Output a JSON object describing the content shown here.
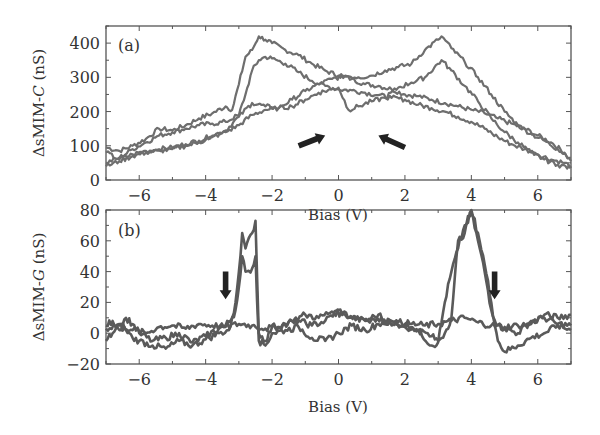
{
  "chart_data": [
    {
      "panel": "(a)",
      "type": "line",
      "title": "",
      "xlabel": "Bias (V)",
      "ylabel_prefix": "ΔsMIM-",
      "ylabel_italic": "C",
      "ylabel_suffix": " (nS)",
      "xlim": [
        -7,
        7
      ],
      "ylim": [
        0,
        450
      ],
      "xticks": [
        -6,
        -4,
        -2,
        0,
        2,
        4,
        6
      ],
      "xtick_labels": [
        "−6",
        "−4",
        "−2",
        "0",
        "2",
        "4",
        "6"
      ],
      "yticks": [
        0,
        100,
        200,
        300,
        400
      ],
      "ytick_labels": [
        "0",
        "100",
        "200",
        "300",
        "400"
      ],
      "grid": false,
      "series": [
        {
          "name": "sweep-1",
          "x": [
            -7,
            -6.6,
            -6.2,
            -5.8,
            -5.4,
            -5,
            -4.6,
            -4.2,
            -3.8,
            -3.4,
            -3.2,
            -3.0,
            -2.8,
            -2.6,
            -2.4,
            -2.2,
            -2.0,
            -1.6,
            -1.2,
            -0.8,
            -0.4,
            0,
            0.4,
            0.8,
            1.2,
            1.6,
            2.0,
            2.4,
            2.8,
            3.2,
            3.6,
            4.0,
            4.4,
            4.8,
            5.2,
            5.6,
            6.0,
            6.4,
            6.8,
            7
          ],
          "y": [
            95,
            85,
            100,
            120,
            150,
            145,
            160,
            180,
            195,
            215,
            205,
            280,
            360,
            380,
            420,
            410,
            400,
            380,
            365,
            340,
            320,
            305,
            295,
            280,
            275,
            265,
            250,
            245,
            235,
            225,
            215,
            205,
            195,
            180,
            165,
            150,
            130,
            110,
            80,
            55
          ]
        },
        {
          "name": "sweep-2",
          "x": [
            -7,
            -6.6,
            -6.2,
            -5.8,
            -5.4,
            -5,
            -4.6,
            -4.2,
            -3.8,
            -3.4,
            -3.0,
            -2.8,
            -2.6,
            -2.4,
            -2.2,
            -2.0,
            -1.6,
            -1.2,
            -0.8,
            -0.4,
            0,
            0.4,
            0.8,
            1.2,
            1.6,
            2.0,
            2.4,
            2.8,
            3.2,
            3.6,
            4.0,
            4.4,
            4.8,
            5.2,
            5.6,
            6.0,
            6.4,
            6.8,
            7
          ],
          "y": [
            50,
            65,
            90,
            110,
            130,
            140,
            150,
            160,
            165,
            170,
            190,
            250,
            320,
            350,
            360,
            355,
            340,
            315,
            290,
            275,
            265,
            262,
            255,
            248,
            240,
            235,
            220,
            210,
            200,
            185,
            170,
            150,
            125,
            105,
            90,
            75,
            60,
            50,
            40
          ]
        },
        {
          "name": "sweep-3",
          "x": [
            -7,
            -6.6,
            -6.2,
            -5.8,
            -5.4,
            -5,
            -4.6,
            -4.2,
            -3.8,
            -3.4,
            -3.0,
            -2.6,
            -2.2,
            -1.8,
            -1.4,
            -1.0,
            -0.6,
            -0.2,
            0.2,
            0.6,
            1.0,
            1.4,
            1.8,
            2.2,
            2.6,
            3.0,
            3.1,
            3.4,
            3.8,
            4.2,
            4.6,
            5.0,
            5.4,
            5.8,
            6.2,
            6.6,
            7
          ],
          "y": [
            80,
            60,
            75,
            85,
            90,
            95,
            105,
            115,
            130,
            145,
            185,
            225,
            215,
            210,
            235,
            260,
            280,
            295,
            305,
            300,
            305,
            320,
            330,
            340,
            380,
            410,
            420,
            385,
            345,
            300,
            250,
            200,
            160,
            135,
            115,
            90,
            65
          ]
        },
        {
          "name": "sweep-4",
          "x": [
            -7,
            -6.6,
            -6.2,
            -5.8,
            -5.4,
            -5,
            -4.6,
            -4.2,
            -3.8,
            -3.4,
            -3.0,
            -2.6,
            -2.2,
            -1.8,
            -1.4,
            -1.0,
            -0.6,
            -0.2,
            0.0,
            0.3,
            0.6,
            1.0,
            1.4,
            1.8,
            2.2,
            2.6,
            3.1,
            3.4,
            3.8,
            4.2,
            4.6,
            5.0,
            5.4,
            5.8,
            6.2,
            6.6,
            7
          ],
          "y": [
            40,
            55,
            70,
            80,
            85,
            90,
            100,
            110,
            125,
            140,
            160,
            190,
            205,
            210,
            215,
            235,
            255,
            265,
            270,
            205,
            215,
            230,
            240,
            270,
            285,
            300,
            350,
            320,
            275,
            230,
            180,
            140,
            110,
            80,
            60,
            45,
            35
          ]
        }
      ],
      "annotations": [
        {
          "type": "arrow",
          "label": "sweep-direction-right",
          "from": [
            -1.2,
            100
          ],
          "to": [
            -0.4,
            130
          ]
        },
        {
          "type": "arrow",
          "label": "sweep-direction-left",
          "from": [
            2.0,
            95
          ],
          "to": [
            1.2,
            130
          ]
        }
      ]
    },
    {
      "panel": "(b)",
      "type": "line",
      "title": "",
      "xlabel": "Bias (V)",
      "ylabel_prefix": "ΔsMIM-",
      "ylabel_italic": "G",
      "ylabel_suffix": " (nS)",
      "xlim": [
        -7,
        7
      ],
      "ylim": [
        -20,
        80
      ],
      "xticks": [
        -6,
        -4,
        -2,
        0,
        2,
        4,
        6
      ],
      "xtick_labels": [
        "−6",
        "−4",
        "−2",
        "0",
        "2",
        "4",
        "6"
      ],
      "yticks": [
        -20,
        0,
        20,
        40,
        60,
        80
      ],
      "ytick_labels": [
        "−20",
        "0",
        "20",
        "40",
        "60",
        "80"
      ],
      "grid": false,
      "series": [
        {
          "name": "sweep-1",
          "x": [
            -7,
            -6.8,
            -6.6,
            -6.4,
            -6.2,
            -6.0,
            -5.6,
            -5.2,
            -4.8,
            -4.4,
            -4.0,
            -3.6,
            -3.4,
            -3.2,
            -3.1,
            -3.0,
            -2.9,
            -2.8,
            -2.6,
            -2.5,
            -2.4,
            -2.2,
            -2.0,
            -1.6,
            -1.2,
            -0.8,
            -0.4,
            0,
            0.4,
            0.8,
            1.2,
            1.6,
            2.0,
            2.4,
            2.8,
            3.0,
            3.2,
            3.4,
            3.6,
            3.8,
            4.0,
            4.2,
            4.4,
            4.6,
            4.8,
            5.0,
            5.4,
            5.8,
            6.2,
            6.6,
            7
          ],
          "y": [
            5,
            8,
            2,
            10,
            6,
            0,
            -5,
            -3,
            0,
            -6,
            -2,
            3,
            5,
            10,
            20,
            40,
            65,
            55,
            65,
            73,
            0,
            -5,
            4,
            6,
            8,
            5,
            8,
            15,
            10,
            8,
            12,
            5,
            6,
            2,
            -8,
            -6,
            20,
            40,
            55,
            70,
            78,
            60,
            40,
            15,
            5,
            3,
            0,
            8,
            10,
            6,
            5
          ]
        },
        {
          "name": "sweep-2",
          "x": [
            -7,
            -6.8,
            -6.6,
            -6.4,
            -6.2,
            -6.0,
            -5.6,
            -5.2,
            -4.8,
            -4.4,
            -4.0,
            -3.6,
            -3.3,
            -3.1,
            -3.0,
            -2.9,
            -2.8,
            -2.6,
            -2.5,
            -2.4,
            -2.2,
            -2.0,
            -1.6,
            -1.2,
            -0.8,
            -0.4,
            0,
            0.4,
            0.8,
            1.2,
            1.6,
            2.0,
            2.4,
            2.8,
            3.0,
            3.2,
            3.4,
            3.6,
            3.8,
            4.0,
            4.2,
            4.4,
            4.6,
            4.8,
            5.0,
            5.4,
            5.8,
            6.2,
            6.6,
            7
          ],
          "y": [
            -5,
            0,
            5,
            2,
            -3,
            -5,
            -8,
            -10,
            -5,
            -8,
            -4,
            0,
            2,
            15,
            30,
            50,
            40,
            42,
            50,
            -5,
            -8,
            0,
            2,
            4,
            -3,
            -5,
            0,
            5,
            2,
            6,
            8,
            4,
            2,
            -2,
            -5,
            0,
            10,
            60,
            65,
            80,
            65,
            45,
            20,
            -5,
            -12,
            -8,
            -3,
            0,
            5,
            2,
            0
          ]
        },
        {
          "name": "sweep-3",
          "x": [
            -7,
            -6.6,
            -6.2,
            -5.8,
            -5.4,
            -5.0,
            -4.6,
            -4.2,
            -3.8,
            -3.4,
            -3.0,
            -2.6,
            -2.2,
            -1.8,
            -1.4,
            -1.0,
            -0.6,
            -0.2,
            0.2,
            0.6,
            1.0,
            1.4,
            1.8,
            2.2,
            2.6,
            3.0,
            3.4,
            3.8,
            4.2,
            4.6,
            5.0,
            5.4,
            5.8,
            6.2,
            6.6,
            7
          ],
          "y": [
            3,
            6,
            2,
            0,
            4,
            5,
            3,
            6,
            5,
            4,
            6,
            5,
            3,
            4,
            8,
            12,
            10,
            14,
            12,
            10,
            9,
            8,
            7,
            6,
            5,
            6,
            8,
            10,
            7,
            5,
            4,
            5,
            6,
            12,
            10,
            12
          ]
        }
      ],
      "annotations": [
        {
          "type": "arrow",
          "label": "sweep-direction-down",
          "from": [
            -3.4,
            40
          ],
          "to": [
            -3.4,
            22
          ]
        },
        {
          "type": "arrow",
          "label": "sweep-direction-down",
          "from": [
            4.7,
            40
          ],
          "to": [
            4.7,
            22
          ]
        }
      ]
    }
  ]
}
